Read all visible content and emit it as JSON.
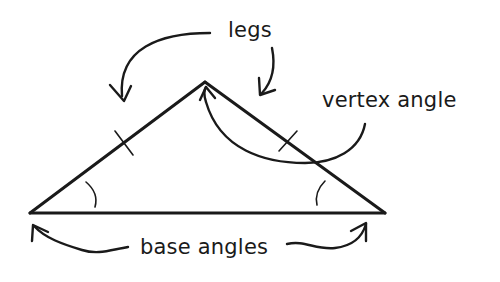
{
  "diagram": {
    "labels": {
      "legs": "legs",
      "vertex_angle": "vertex angle",
      "base_angles": "base angles"
    },
    "colors": {
      "ink": "#1a1a1a",
      "background": "#ffffff"
    },
    "shapes": {
      "triangle": {
        "apex": [
          205,
          82
        ],
        "left_base": [
          30,
          213
        ],
        "right_base": [
          385,
          213
        ]
      },
      "tick_marks": [
        "left-leg",
        "right-leg"
      ],
      "angle_arcs": [
        "left-base-angle",
        "right-base-angle"
      ],
      "arrows": [
        "legs-to-left-leg",
        "legs-to-right-leg",
        "vertex-angle-to-apex",
        "base-angles-to-left-vertex",
        "base-angles-to-right-vertex"
      ]
    }
  }
}
